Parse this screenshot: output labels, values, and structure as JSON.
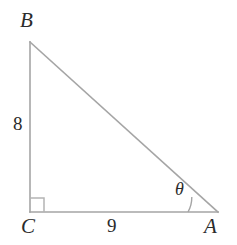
{
  "figure": {
    "background_color": "#ffffff",
    "stroke_color": "#a5a5a5",
    "marker_color": "#b4b4b4",
    "text_color": "#2b2b2b",
    "width": 237,
    "height": 245
  },
  "vertices": {
    "B": {
      "label": "B",
      "x": 30,
      "y": 42
    },
    "C": {
      "label": "C",
      "x": 30,
      "y": 212
    },
    "A": {
      "label": "A",
      "x": 218,
      "y": 212
    }
  },
  "sides": {
    "BC": {
      "label": "8",
      "value": 8,
      "orientation": "vertical"
    },
    "CA": {
      "label": "9",
      "value": 9,
      "orientation": "horizontal"
    },
    "BA": {
      "label": "",
      "value": null,
      "orientation": "hypotenuse"
    }
  },
  "angles": {
    "at_A": {
      "label": "θ",
      "arc_radius": 30
    },
    "at_C": {
      "label": "",
      "marker": "right-angle-square",
      "size": 14
    }
  }
}
